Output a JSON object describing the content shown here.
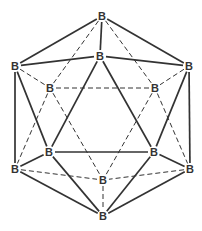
{
  "colors": {
    "line": "#333333",
    "label": "#333333",
    "background": "#ffffff"
  },
  "atoms": [
    {
      "id": "top",
      "label": "B",
      "x": 102,
      "y": 16
    },
    {
      "id": "upper-front",
      "label": "B",
      "x": 100,
      "y": 56
    },
    {
      "id": "upper-left",
      "label": "B",
      "x": 15,
      "y": 66
    },
    {
      "id": "upper-right",
      "label": "B",
      "x": 189,
      "y": 66
    },
    {
      "id": "back-upper-left",
      "label": "B",
      "x": 50,
      "y": 88
    },
    {
      "id": "back-upper-right",
      "label": "B",
      "x": 155,
      "y": 88
    },
    {
      "id": "lower-front-left",
      "label": "B",
      "x": 49,
      "y": 152
    },
    {
      "id": "lower-front-right",
      "label": "B",
      "x": 154,
      "y": 152
    },
    {
      "id": "lower-left",
      "label": "B",
      "x": 15,
      "y": 169
    },
    {
      "id": "lower-right",
      "label": "B",
      "x": 190,
      "y": 169
    },
    {
      "id": "back-lower",
      "label": "B",
      "x": 103,
      "y": 180
    },
    {
      "id": "bottom",
      "label": "B",
      "x": 103,
      "y": 216
    }
  ],
  "bonds": [
    {
      "a": "top",
      "b": "upper-left",
      "style": "solid"
    },
    {
      "a": "top",
      "b": "upper-right",
      "style": "solid"
    },
    {
      "a": "top",
      "b": "upper-front",
      "style": "solid"
    },
    {
      "a": "top",
      "b": "back-upper-left",
      "style": "dashed"
    },
    {
      "a": "top",
      "b": "back-upper-right",
      "style": "dashed"
    },
    {
      "a": "upper-front",
      "b": "upper-left",
      "style": "solid"
    },
    {
      "a": "upper-front",
      "b": "upper-right",
      "style": "solid"
    },
    {
      "a": "upper-front",
      "b": "lower-front-left",
      "style": "solid"
    },
    {
      "a": "upper-front",
      "b": "lower-front-right",
      "style": "solid"
    },
    {
      "a": "upper-left",
      "b": "back-upper-left",
      "style": "dashed"
    },
    {
      "a": "upper-left",
      "b": "lower-left",
      "style": "solid"
    },
    {
      "a": "upper-left",
      "b": "lower-front-left",
      "style": "solid"
    },
    {
      "a": "upper-right",
      "b": "back-upper-right",
      "style": "dashed"
    },
    {
      "a": "upper-right",
      "b": "lower-right",
      "style": "solid"
    },
    {
      "a": "upper-right",
      "b": "lower-front-right",
      "style": "solid"
    },
    {
      "a": "back-upper-left",
      "b": "back-upper-right",
      "style": "dashed"
    },
    {
      "a": "back-upper-left",
      "b": "lower-left",
      "style": "dashed"
    },
    {
      "a": "back-upper-left",
      "b": "back-lower",
      "style": "dashed"
    },
    {
      "a": "back-upper-right",
      "b": "lower-right",
      "style": "dashed"
    },
    {
      "a": "back-upper-right",
      "b": "back-lower",
      "style": "dashed"
    },
    {
      "a": "lower-front-left",
      "b": "lower-front-right",
      "style": "solid"
    },
    {
      "a": "lower-front-left",
      "b": "lower-left",
      "style": "solid"
    },
    {
      "a": "lower-front-left",
      "b": "bottom",
      "style": "solid"
    },
    {
      "a": "lower-front-right",
      "b": "lower-right",
      "style": "solid"
    },
    {
      "a": "lower-front-right",
      "b": "bottom",
      "style": "solid"
    },
    {
      "a": "lower-left",
      "b": "back-lower",
      "style": "dashed"
    },
    {
      "a": "lower-left",
      "b": "bottom",
      "style": "solid"
    },
    {
      "a": "lower-right",
      "b": "back-lower",
      "style": "dashed"
    },
    {
      "a": "lower-right",
      "b": "bottom",
      "style": "solid"
    },
    {
      "a": "back-lower",
      "b": "bottom",
      "style": "dashed"
    }
  ]
}
